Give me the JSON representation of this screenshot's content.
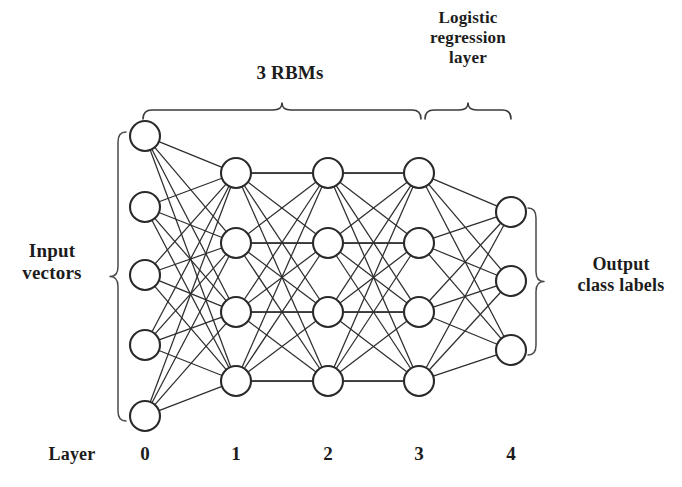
{
  "figure": {
    "labels": {
      "rbms": "3 RBMs",
      "logistic_regression": "Logistic\nregression\nlayer",
      "input_vectors": "Input\nvectors",
      "output_class_labels": "Output\nclass labels",
      "layer_axis": "Layer"
    },
    "layer_ticks": [
      "0",
      "1",
      "2",
      "3",
      "4"
    ],
    "colors": {
      "background": "#ffffff",
      "node_stroke": "#2a2a2a",
      "node_fill": "#ffffff",
      "edge": "#2e2e2e",
      "brace": "#3a3a3a",
      "text": "#1c1c1c"
    }
  },
  "chart_data": {
    "type": "diagram",
    "node_radius": 15,
    "layers": [
      {
        "index": 0,
        "tick_label": "0",
        "name": "input-layer",
        "node_count": 5,
        "x": 145,
        "node_y": [
          136,
          207,
          275,
          345,
          416
        ]
      },
      {
        "index": 1,
        "tick_label": "1",
        "name": "hidden-layer-1",
        "node_count": 4,
        "x": 236,
        "node_y": [
          173,
          243,
          312,
          381
        ]
      },
      {
        "index": 2,
        "tick_label": "2",
        "name": "hidden-layer-2",
        "node_count": 4,
        "x": 328,
        "node_y": [
          173,
          243,
          312,
          381
        ]
      },
      {
        "index": 3,
        "tick_label": "3",
        "name": "hidden-layer-3",
        "node_count": 4,
        "x": 419,
        "node_y": [
          173,
          243,
          312,
          381
        ]
      },
      {
        "index": 4,
        "tick_label": "4",
        "name": "output-layer",
        "node_count": 3,
        "x": 511,
        "node_y": [
          212,
          281,
          350
        ]
      }
    ],
    "connections": [
      {
        "from_layer": 0,
        "to_layer": 1,
        "type": "fully-connected"
      },
      {
        "from_layer": 1,
        "to_layer": 2,
        "type": "fully-connected"
      },
      {
        "from_layer": 2,
        "to_layer": 3,
        "type": "fully-connected"
      },
      {
        "from_layer": 3,
        "to_layer": 4,
        "type": "fully-connected"
      }
    ],
    "braces": [
      {
        "name": "rbms-brace",
        "orientation": "top",
        "from_x": 143,
        "to_x": 421,
        "y": 110,
        "label": "3 RBMs"
      },
      {
        "name": "logreg-brace",
        "orientation": "top",
        "from_x": 425,
        "to_x": 511,
        "y": 110,
        "label": "Logistic regression layer"
      },
      {
        "name": "input-brace",
        "orientation": "left",
        "from_y": 132,
        "to_y": 421,
        "x": 118,
        "label": "Input vectors"
      },
      {
        "name": "output-brace",
        "orientation": "right",
        "from_y": 208,
        "to_y": 355,
        "x": 536,
        "label": "Output class labels"
      }
    ]
  }
}
